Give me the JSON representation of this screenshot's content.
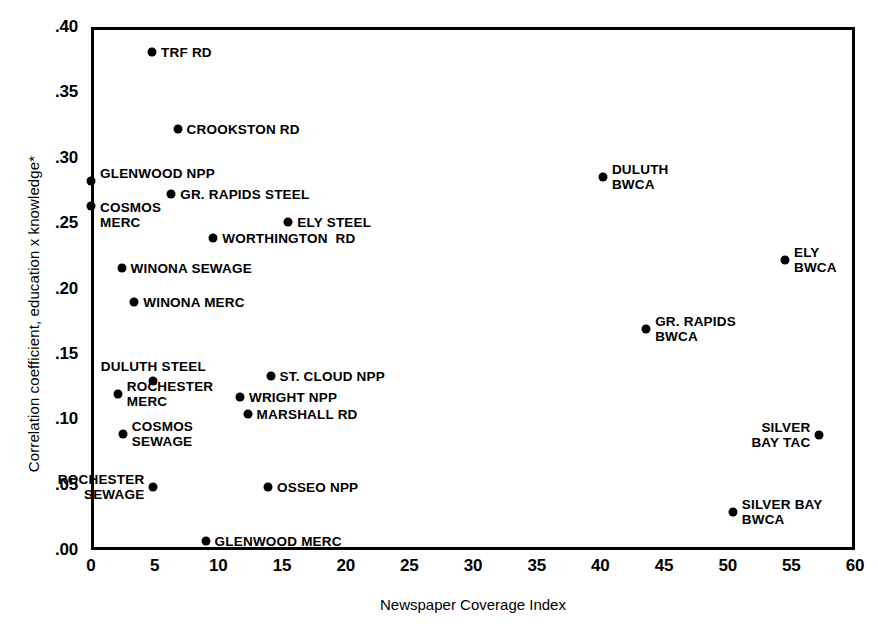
{
  "chart_data": {
    "type": "scatter",
    "title": "",
    "xlabel": "Newspaper Coverage Index",
    "ylabel": "Correlation coefficient, education x knowledge*",
    "xlim": [
      0,
      60
    ],
    "ylim": [
      0.0,
      0.4
    ],
    "xticks": [
      "0",
      "5",
      "10",
      "15",
      "20",
      "25",
      "30",
      "35",
      "40",
      "45",
      "50",
      "55",
      "60"
    ],
    "yticks": [
      ".00",
      ".05",
      ".10",
      ".15",
      ".20",
      ".25",
      ".30",
      ".35",
      ".40"
    ],
    "grid": false,
    "legend": "none",
    "points": [
      {
        "label": "TRF RD",
        "x": 4.8,
        "y": 0.381,
        "pos": "right"
      },
      {
        "label": "CROOKSTON RD",
        "x": 6.8,
        "y": 0.322,
        "pos": "right"
      },
      {
        "label": "GLENWOOD NPP",
        "x": 0.0,
        "y": 0.282,
        "pos": "above-right"
      },
      {
        "label": "DULUTH\nBWCA",
        "x": 40.2,
        "y": 0.285,
        "pos": "right"
      },
      {
        "label": "COSMOS\nMERC",
        "x": 0.0,
        "y": 0.263,
        "pos": "right-below"
      },
      {
        "label": "GR. RAPIDS STEEL",
        "x": 6.3,
        "y": 0.272,
        "pos": "right"
      },
      {
        "label": "ELY STEEL",
        "x": 15.5,
        "y": 0.251,
        "pos": "right"
      },
      {
        "label": "WORTHINGTON  RD",
        "x": 9.6,
        "y": 0.239,
        "pos": "right"
      },
      {
        "label": "ELY\nBWCA",
        "x": 54.5,
        "y": 0.222,
        "pos": "right"
      },
      {
        "label": "WINONA SEWAGE",
        "x": 2.4,
        "y": 0.216,
        "pos": "right"
      },
      {
        "label": "WINONA MERC",
        "x": 3.4,
        "y": 0.19,
        "pos": "right"
      },
      {
        "label": "GR. RAPIDS\nBWCA",
        "x": 43.6,
        "y": 0.169,
        "pos": "right"
      },
      {
        "label": "ST. CLOUD NPP",
        "x": 14.1,
        "y": 0.133,
        "pos": "right"
      },
      {
        "label": "DULUTH STEEL",
        "x": 4.9,
        "y": 0.129,
        "pos": "above"
      },
      {
        "label": "ROCHESTER\nMERC",
        "x": 2.1,
        "y": 0.119,
        "pos": "right"
      },
      {
        "label": "WRIGHT NPP",
        "x": 11.7,
        "y": 0.117,
        "pos": "right"
      },
      {
        "label": "MARSHALL RD",
        "x": 12.3,
        "y": 0.104,
        "pos": "right"
      },
      {
        "label": "COSMOS\nSEWAGE",
        "x": 2.5,
        "y": 0.089,
        "pos": "right"
      },
      {
        "label": "SILVER\nBAY TAC",
        "x": 57.2,
        "y": 0.088,
        "pos": "left"
      },
      {
        "label": "ROCHESTER\nSEWAGE",
        "x": 4.9,
        "y": 0.048,
        "pos": "left"
      },
      {
        "label": "OSSEO NPP",
        "x": 13.9,
        "y": 0.048,
        "pos": "right"
      },
      {
        "label": "SILVER BAY\nBWCA",
        "x": 50.4,
        "y": 0.029,
        "pos": "right"
      },
      {
        "label": "GLENWOOD MERC",
        "x": 9.0,
        "y": 0.007,
        "pos": "right"
      }
    ]
  },
  "colors": {
    "ink": "#000000",
    "background": "#ffffff"
  }
}
